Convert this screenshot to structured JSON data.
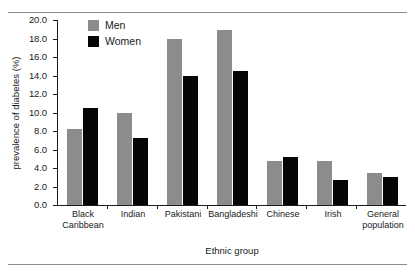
{
  "chart_data": {
    "type": "bar",
    "title": "",
    "xlabel": "Ethnic group",
    "ylabel": "prevalence of diabetes (%)",
    "ylim": [
      0.0,
      20.0
    ],
    "ytick_step": 2.0,
    "yticks": [
      "20.0",
      "18.0",
      "16.0",
      "14.0",
      "12.0",
      "10.0",
      "8.0",
      "6.0",
      "4.0",
      "2.0",
      "0.0"
    ],
    "ytick_values": [
      20.0,
      18.0,
      16.0,
      14.0,
      12.0,
      10.0,
      8.0,
      6.0,
      4.0,
      2.0,
      0.0
    ],
    "grid": false,
    "legend_position": "top-left-inside",
    "categories": [
      "Black Caribbean",
      "Indian",
      "Pakistani",
      "Bangladeshi",
      "Chinese",
      "Irish",
      "General population"
    ],
    "category_lines": [
      [
        "Black",
        "Caribbean"
      ],
      [
        "Indian"
      ],
      [
        "Pakistani"
      ],
      [
        "Bangladeshi"
      ],
      [
        "Chinese"
      ],
      [
        "Irish"
      ],
      [
        "General",
        "population"
      ]
    ],
    "series": [
      {
        "name": "Men",
        "color": "#8c8c8c",
        "values": [
          8.2,
          9.9,
          17.9,
          18.9,
          4.8,
          4.8,
          3.5
        ]
      },
      {
        "name": "Women",
        "color": "#050505",
        "values": [
          10.5,
          7.2,
          13.9,
          14.5,
          5.2,
          2.7,
          3.0
        ]
      }
    ]
  },
  "legend": {
    "items": [
      {
        "label": "Men",
        "color": "#8c8c8c"
      },
      {
        "label": "Women",
        "color": "#050505"
      }
    ]
  },
  "axes": {
    "y_title": "prevalence of diabetes (%)",
    "x_title": "Ethnic group"
  }
}
